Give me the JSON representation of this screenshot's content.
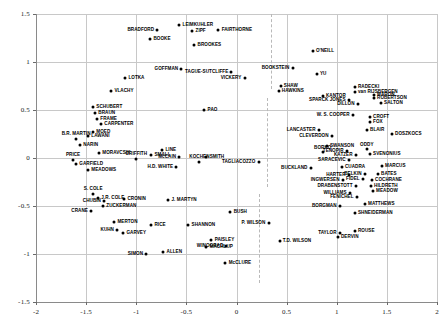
{
  "chart_data": {
    "type": "scatter",
    "title": "",
    "subtitle": "",
    "xlabel": "",
    "ylabel": "",
    "xlim": [
      -2.0,
      2.0
    ],
    "ylim": [
      -1.5,
      1.5
    ],
    "xticks": [
      -2,
      -1.5,
      -1,
      -0.5,
      0,
      0.5,
      1,
      1.5,
      2
    ],
    "xticklabels": [
      "-2",
      "-1.5",
      "-1",
      "-0.5",
      "0",
      "0.5",
      "1",
      "1.5",
      "2"
    ],
    "yticks": [
      -1.5,
      -1,
      -0.5,
      0,
      0.5,
      1,
      1.5
    ],
    "yticklabels": [
      "-1.5",
      "-1",
      "-0.5",
      "0",
      "0.5",
      "1",
      "1.5"
    ],
    "grid": true,
    "legend": null,
    "marker": {
      "shape": "circle",
      "color": "#000000",
      "size": 3
    },
    "point_label_color": "#000000",
    "points": [
      {
        "label": "LEIMKUHLER",
        "x": -0.57,
        "y": 1.39,
        "pos": "r"
      },
      {
        "label": "BRADFORD",
        "x": -0.79,
        "y": 1.33,
        "pos": "l"
      },
      {
        "label": "ZIPF",
        "x": -0.44,
        "y": 1.32,
        "pos": "r"
      },
      {
        "label": "FAIRTHORNE",
        "x": -0.18,
        "y": 1.33,
        "pos": "r"
      },
      {
        "label": "BOOKE",
        "x": -0.86,
        "y": 1.24,
        "pos": "r"
      },
      {
        "label": "BROOKES",
        "x": -0.42,
        "y": 1.18,
        "pos": "r"
      },
      {
        "label": "O'NEILL",
        "x": 0.76,
        "y": 1.11,
        "pos": "r"
      },
      {
        "label": "GOFFMAN",
        "x": -0.55,
        "y": 0.93,
        "pos": "l"
      },
      {
        "label": "TAGUE-SUTCLIFFE",
        "x": -0.05,
        "y": 0.9,
        "pos": "l"
      },
      {
        "label": "BOOKSTEIN",
        "x": 0.56,
        "y": 0.94,
        "pos": "l"
      },
      {
        "label": "YU",
        "x": 0.8,
        "y": 0.87,
        "pos": "r"
      },
      {
        "label": "VICKERY",
        "x": 0.08,
        "y": 0.83,
        "pos": "l"
      },
      {
        "label": "LOTKA",
        "x": -1.11,
        "y": 0.83,
        "pos": "r"
      },
      {
        "label": "SHAW",
        "x": 0.44,
        "y": 0.75,
        "pos": "r"
      },
      {
        "label": "RADECKI",
        "x": 1.18,
        "y": 0.74,
        "pos": "r"
      },
      {
        "label": "HAWKINS",
        "x": 0.42,
        "y": 0.7,
        "pos": "r"
      },
      {
        "label": "van RIJSBERGEN",
        "x": 1.18,
        "y": 0.69,
        "pos": "r"
      },
      {
        "label": "VLACHY",
        "x": -1.25,
        "y": 0.7,
        "pos": "r"
      },
      {
        "label": "MARON",
        "x": 1.37,
        "y": 0.66,
        "pos": "r"
      },
      {
        "label": "KANTOR",
        "x": 0.86,
        "y": 0.65,
        "pos": "r"
      },
      {
        "label": "ROBERTSON",
        "x": 1.37,
        "y": 0.62,
        "pos": "r"
      },
      {
        "label": "SPARCK JONES",
        "x": 1.12,
        "y": 0.6,
        "pos": "l"
      },
      {
        "label": "SALTON",
        "x": 1.44,
        "y": 0.57,
        "pos": "r"
      },
      {
        "label": "DILLON",
        "x": 1.21,
        "y": 0.56,
        "pos": "l"
      },
      {
        "label": "SCHUBERT",
        "x": -1.43,
        "y": 0.53,
        "pos": "r"
      },
      {
        "label": "BRAUN",
        "x": -1.41,
        "y": 0.47,
        "pos": "r"
      },
      {
        "label": "FRAME",
        "x": -1.39,
        "y": 0.41,
        "pos": "r"
      },
      {
        "label": "PAO",
        "x": -0.32,
        "y": 0.5,
        "pos": "r"
      },
      {
        "label": "W. S. COOPER",
        "x": 1.16,
        "y": 0.45,
        "pos": "l"
      },
      {
        "label": "CROFT",
        "x": 1.33,
        "y": 0.43,
        "pos": "r"
      },
      {
        "label": "CARPENTER",
        "x": -1.35,
        "y": 0.35,
        "pos": "r"
      },
      {
        "label": "FOX",
        "x": 1.33,
        "y": 0.37,
        "pos": "r"
      },
      {
        "label": "LANCASTER",
        "x": 0.82,
        "y": 0.29,
        "pos": "l"
      },
      {
        "label": "BLAIR",
        "x": 1.3,
        "y": 0.29,
        "pos": "r"
      },
      {
        "label": "MOED",
        "x": -1.43,
        "y": 0.27,
        "pos": "r"
      },
      {
        "label": "LAWANI",
        "x": -1.48,
        "y": 0.23,
        "pos": "r"
      },
      {
        "label": "DOSZKOCS",
        "x": 1.55,
        "y": 0.25,
        "pos": "r"
      },
      {
        "label": "CLEVERDON",
        "x": 0.95,
        "y": 0.23,
        "pos": "l"
      },
      {
        "label": "B.R. MARTIN",
        "x": -1.6,
        "y": 0.2,
        "pos": "cb"
      },
      {
        "label": "NARIN",
        "x": -1.56,
        "y": 0.14,
        "pos": "r"
      },
      {
        "label": "SWANSON",
        "x": 0.9,
        "y": 0.12,
        "pos": "r"
      },
      {
        "label": "TENOPIR",
        "x": 1.1,
        "y": 0.07,
        "pos": "l"
      },
      {
        "label": "ODDY",
        "x": 1.3,
        "y": 0.09,
        "pos": "c"
      },
      {
        "label": "BORKO",
        "x": 0.86,
        "y": 0.06,
        "pos": "c"
      },
      {
        "label": "MORAVCSIK",
        "x": -1.37,
        "y": 0.05,
        "pos": "r"
      },
      {
        "label": "LINE",
        "x": -0.74,
        "y": 0.08,
        "pos": "r"
      },
      {
        "label": "SMALL",
        "x": -0.85,
        "y": 0.03,
        "pos": "r"
      },
      {
        "label": "KATZER",
        "x": 1.19,
        "y": 0.03,
        "pos": "l"
      },
      {
        "label": "SVENONIUS",
        "x": 1.33,
        "y": 0.04,
        "pos": "r"
      },
      {
        "label": "McCAIN",
        "x": -0.57,
        "y": 0.01,
        "pos": "l"
      },
      {
        "label": "GRIFFITH",
        "x": -1.0,
        "y": -0.01,
        "pos": "c"
      },
      {
        "label": "SARACEVIC",
        "x": 1.12,
        "y": -0.02,
        "pos": "l"
      },
      {
        "label": "SMITH",
        "x": -0.3,
        "y": 0.01,
        "pos": "r"
      },
      {
        "label": "PRICE",
        "x": -1.63,
        "y": -0.02,
        "pos": "cb"
      },
      {
        "label": "GARFIELD",
        "x": -1.6,
        "y": -0.06,
        "pos": "r"
      },
      {
        "label": "KOCHEN",
        "x": -0.37,
        "y": -0.04,
        "pos": "c"
      },
      {
        "label": "TAGLIACOZZO",
        "x": 0.22,
        "y": -0.04,
        "pos": "l"
      },
      {
        "label": "BUCKLAND",
        "x": 0.74,
        "y": -0.1,
        "pos": "l"
      },
      {
        "label": "CUADRA",
        "x": 1.05,
        "y": -0.09,
        "pos": "r"
      },
      {
        "label": "MARCUS",
        "x": 1.45,
        "y": -0.08,
        "pos": "r"
      },
      {
        "label": "H.D. WHITE",
        "x": -0.6,
        "y": -0.09,
        "pos": "l"
      },
      {
        "label": "MEADOWS",
        "x": -1.48,
        "y": -0.13,
        "pos": "r"
      },
      {
        "label": "HARTER",
        "x": 1.12,
        "y": -0.18,
        "pos": "l"
      },
      {
        "label": "BELKIN",
        "x": 1.28,
        "y": -0.17,
        "pos": "l"
      },
      {
        "label": "BATES",
        "x": 1.41,
        "y": -0.17,
        "pos": "r"
      },
      {
        "label": "INGWERSEN",
        "x": 1.06,
        "y": -0.23,
        "pos": "l"
      },
      {
        "label": "FIDEL",
        "x": 1.26,
        "y": -0.22,
        "pos": "l"
      },
      {
        "label": "COCHRANE",
        "x": 1.35,
        "y": -0.23,
        "pos": "r"
      },
      {
        "label": "DRABENSTOTT",
        "x": 1.19,
        "y": -0.29,
        "pos": "l"
      },
      {
        "label": "HILDRETH",
        "x": 1.34,
        "y": -0.29,
        "pos": "r"
      },
      {
        "label": "S. COLE",
        "x": -1.43,
        "y": -0.38,
        "pos": "ct"
      },
      {
        "label": "MEADOW",
        "x": 1.36,
        "y": -0.34,
        "pos": "r"
      },
      {
        "label": "J.R. COLE",
        "x": -1.38,
        "y": -0.42,
        "pos": "r"
      },
      {
        "label": "WILLIAMS",
        "x": 1.13,
        "y": -0.36,
        "pos": "l"
      },
      {
        "label": "CRONIN",
        "x": -1.12,
        "y": -0.43,
        "pos": "r"
      },
      {
        "label": "CHUBIN",
        "x": -1.32,
        "y": -0.45,
        "pos": "l"
      },
      {
        "label": "FENICHEL",
        "x": 1.2,
        "y": -0.41,
        "pos": "l"
      },
      {
        "label": "ZUCKERMAN",
        "x": -1.33,
        "y": -0.5,
        "pos": "r"
      },
      {
        "label": "J. MARTYN",
        "x": -0.68,
        "y": -0.44,
        "pos": "r"
      },
      {
        "label": "MATTHEWS",
        "x": 1.28,
        "y": -0.48,
        "pos": "r"
      },
      {
        "label": "BORGMAN",
        "x": 1.03,
        "y": -0.5,
        "pos": "l"
      },
      {
        "label": "CRANE",
        "x": -1.45,
        "y": -0.55,
        "pos": "l"
      },
      {
        "label": "BUSH",
        "x": -0.06,
        "y": -0.56,
        "pos": "r"
      },
      {
        "label": "SHNEIDERMAN",
        "x": 1.18,
        "y": -0.57,
        "pos": "r"
      },
      {
        "label": "MERTON",
        "x": -1.22,
        "y": -0.67,
        "pos": "r"
      },
      {
        "label": "RICE",
        "x": -0.85,
        "y": -0.7,
        "pos": "r"
      },
      {
        "label": "SHANNON",
        "x": -0.48,
        "y": -0.7,
        "pos": "r"
      },
      {
        "label": "P. WILSON",
        "x": 0.32,
        "y": -0.68,
        "pos": "l"
      },
      {
        "label": "KUHN",
        "x": -1.19,
        "y": -0.75,
        "pos": "l"
      },
      {
        "label": "GARVEY",
        "x": -1.13,
        "y": -0.78,
        "pos": "r"
      },
      {
        "label": "TAYLOR",
        "x": 1.03,
        "y": -0.78,
        "pos": "l"
      },
      {
        "label": "ROUSE",
        "x": 1.18,
        "y": -0.76,
        "pos": "r"
      },
      {
        "label": "DERVIN",
        "x": 1.01,
        "y": -0.82,
        "pos": "r"
      },
      {
        "label": "PAISLEY",
        "x": -0.25,
        "y": -0.85,
        "pos": "r"
      },
      {
        "label": "T.D. WILSON",
        "x": 0.43,
        "y": -0.86,
        "pos": "r"
      },
      {
        "label": "WINOGRAD",
        "x": -0.1,
        "y": -0.92,
        "pos": "l"
      },
      {
        "label": "MACHLUP",
        "x": -0.3,
        "y": -0.93,
        "pos": "r"
      },
      {
        "label": "ALLEN",
        "x": -0.73,
        "y": -0.98,
        "pos": "r"
      },
      {
        "label": "SIMON",
        "x": -0.9,
        "y": -1.0,
        "pos": "l"
      },
      {
        "label": "McCLURE",
        "x": -0.11,
        "y": -1.09,
        "pos": "r"
      }
    ]
  }
}
